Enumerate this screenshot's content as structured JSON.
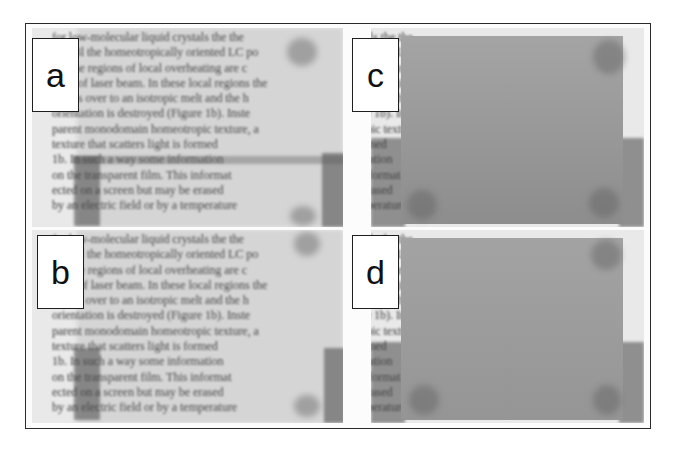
{
  "figure": {
    "panels": [
      {
        "id": "a",
        "label": "a",
        "state": "text visible through film"
      },
      {
        "id": "b",
        "label": "b",
        "state": "text visible through film"
      },
      {
        "id": "c",
        "label": "c",
        "state": "scattering region obscures text"
      },
      {
        "id": "d",
        "label": "d",
        "state": "scattering region obscures text"
      }
    ],
    "text_lines": [
      "for low-molecular liquid crystals the the",
      "film 3l the homeotropically oriented LC po",
      "1a) the regions of local overheating are c",
      "e aid of laser beam. In these local regions the",
      "passes over to an isotropic melt and the h",
      "orientation is destroyed (Figure 1b). Inste",
      "parent monodomain homeotropic texture, a",
      "texture that scatters light is formed",
      "1b. In such a way some information",
      "on the transparent film. This informat",
      "ected on a screen but may be erased",
      "by an electric field or by a temperature"
    ],
    "colors": {
      "frame_border": "#2a2a2a",
      "label_border": "#1e1e1e",
      "text": "#3c3c3c",
      "gray_field": "#999999"
    }
  }
}
